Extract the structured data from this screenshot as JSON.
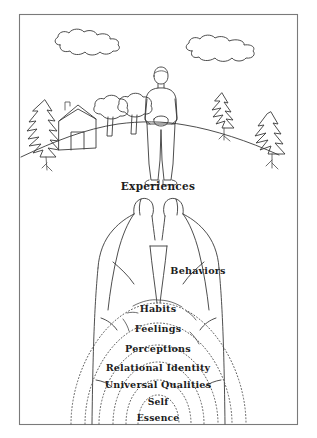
{
  "figure": {
    "title_visible": false,
    "background_color": "#ffffff",
    "frame_color": "#7a7a7a",
    "ink_color": "#3a3a3a",
    "dotted_color": "#555555",
    "label_color": "#1d1d1d"
  },
  "labels": {
    "experiences": "Experiences",
    "behaviors": "Behaviors",
    "habits": "Habits",
    "feelings": "Feelings",
    "perceptions": "Perceptions",
    "relational_identity": "Relational Identity",
    "universal_qualities": "Universal Qualities",
    "self": "Self",
    "essence": "Essence"
  },
  "layers_outer_to_inner": [
    "Experiences",
    "Behaviors",
    "Habits",
    "Feelings",
    "Perceptions",
    "Relational Identity",
    "Universal Qualities",
    "Self",
    "Essence"
  ],
  "scene_elements": {
    "clouds": 2,
    "pine_trees": 3,
    "round_trees": 2,
    "houses": 1,
    "people": 1,
    "horizon": "curved hill"
  }
}
